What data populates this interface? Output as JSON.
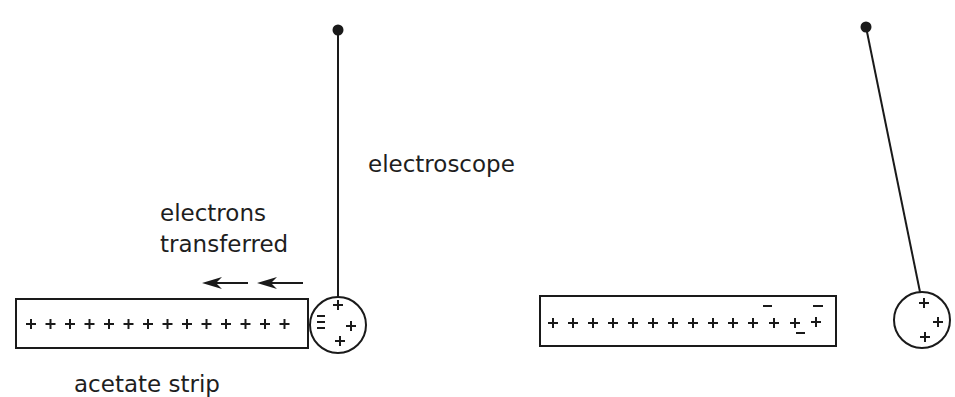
{
  "labels": {
    "electroscope": "electroscope",
    "electrons_line1": "electrons",
    "electrons_line2": "transferred",
    "acetate_strip": "acetate strip"
  },
  "colors": {
    "ink": "#1a1a1a",
    "background": "#ffffff"
  },
  "left_panel": {
    "strip_charges": [
      "+",
      "+",
      "+",
      "+",
      "+",
      "+",
      "+",
      "+",
      "+",
      "+",
      "+",
      "+",
      "+",
      "+"
    ],
    "ball_charges": [
      "+",
      "+",
      "+",
      "-",
      "-",
      "-"
    ],
    "arrows": 2,
    "arrow_direction": "left"
  },
  "right_panel": {
    "strip_charges_plus": 14,
    "strip_charges_minus": 3,
    "ball_charges": [
      "+",
      "+",
      "+"
    ],
    "pendulum_state": "deflected"
  }
}
